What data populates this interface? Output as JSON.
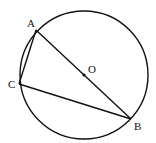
{
  "diagram": {
    "type": "circle-geometry",
    "circle": {
      "center": "O",
      "cx": 84,
      "cy": 75,
      "r": 64
    },
    "points": {
      "A": {
        "label": "A",
        "x": 36,
        "y": 30
      },
      "B": {
        "label": "B",
        "x": 131,
        "y": 119
      },
      "C": {
        "label": "C",
        "x": 19,
        "y": 84
      },
      "O": {
        "label": "O",
        "x": 84,
        "y": 75
      }
    },
    "segments": [
      [
        "A",
        "B"
      ],
      [
        "A",
        "C"
      ],
      [
        "C",
        "B"
      ]
    ],
    "stroke_color": "#111111"
  }
}
